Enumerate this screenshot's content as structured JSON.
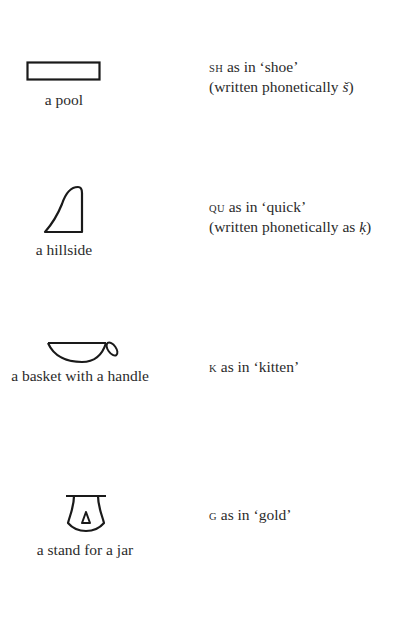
{
  "entries": [
    {
      "icon": "pool-hieroglyph-icon",
      "caption": "a pool",
      "sound_letters": "SH",
      "sound_rest": " as in ‘shoe’",
      "note_prefix": "(written phonetically ",
      "note_symbol": "š",
      "note_suffix": ")"
    },
    {
      "icon": "hillside-hieroglyph-icon",
      "caption": "a hillside",
      "sound_letters": "QU",
      "sound_rest": " as in ‘quick’",
      "note_prefix": "(written phonetically as ",
      "note_symbol": "ḳ",
      "note_suffix": ")"
    },
    {
      "icon": "basket-with-handle-hieroglyph-icon",
      "caption": "a basket with a handle",
      "sound_letters": "K",
      "sound_rest": " as in ‘kitten’"
    },
    {
      "icon": "jar-stand-hieroglyph-icon",
      "caption": "a stand for a jar",
      "sound_letters": "G",
      "sound_rest": " as in ‘gold’"
    }
  ],
  "colors": {
    "ink": "#1a1a1a",
    "text": "#2b2b2b",
    "background": "#ffffff"
  }
}
